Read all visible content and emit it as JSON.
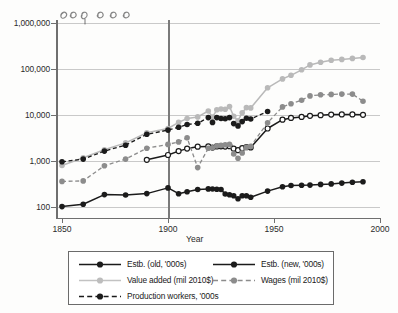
{
  "chart_data": {
    "type": "line",
    "title": "",
    "xlabel": "Year",
    "ylabel": "",
    "yscale": "log",
    "xlim": [
      1850,
      2000
    ],
    "ylim": [
      100,
      1000000
    ],
    "grid": true,
    "legend_position": "below",
    "y_ticks": [
      {
        "value": 100,
        "label": "100"
      },
      {
        "value": 1000,
        "label": "1,000"
      },
      {
        "value": 10000,
        "label": "10,000"
      },
      {
        "value": 100000,
        "label": "100,000"
      },
      {
        "value": 1000000,
        "label": "1,000,000"
      }
    ],
    "x_ticks": [
      {
        "value": 1850,
        "label": "1850"
      },
      {
        "value": 1900,
        "label": "1900"
      },
      {
        "value": 1950,
        "label": "1950"
      },
      {
        "value": 2000,
        "label": "2000"
      }
    ],
    "annotations": [
      {
        "name": "reference-line-1900",
        "type": "vline",
        "x": 1900
      },
      {
        "name": "handwritten-scribble",
        "type": "ink",
        "text": "1900"
      }
    ],
    "series": [
      {
        "name": "Estb. (old, '000s)",
        "color": "#1b1b1b",
        "style": "solid",
        "marker": "filled-circle",
        "points": [
          [
            1850,
            102
          ],
          [
            1860,
            115
          ],
          [
            1870,
            186
          ],
          [
            1880,
            182
          ],
          [
            1890,
            196
          ],
          [
            1900,
            260
          ],
          [
            1905,
            195
          ],
          [
            1909,
            215
          ],
          [
            1914,
            240
          ],
          [
            1919,
            247
          ],
          [
            1921,
            246
          ],
          [
            1923,
            244
          ],
          [
            1925,
            240
          ],
          [
            1927,
            192
          ],
          [
            1929,
            185
          ],
          [
            1931,
            176
          ],
          [
            1933,
            151
          ],
          [
            1935,
            176
          ],
          [
            1937,
            175
          ],
          [
            1939,
            163
          ],
          [
            1947,
            222
          ],
          [
            1954,
            276
          ],
          [
            1958,
            293
          ],
          [
            1963,
            297
          ],
          [
            1967,
            300
          ],
          [
            1972,
            310
          ],
          [
            1977,
            318
          ],
          [
            1982,
            330
          ],
          [
            1987,
            345
          ],
          [
            1992,
            355
          ]
        ]
      },
      {
        "name": "Estb. (new, '000s)",
        "color": "#1b1b1b",
        "style": "solid",
        "marker": "open-circle",
        "points": [
          [
            1890,
            1060
          ],
          [
            1900,
            1350
          ],
          [
            1905,
            1640
          ],
          [
            1909,
            1860
          ],
          [
            1914,
            2050
          ],
          [
            1919,
            2080
          ],
          [
            1921,
            1960
          ],
          [
            1923,
            2080
          ],
          [
            1925,
            2090
          ],
          [
            1927,
            2060
          ],
          [
            1929,
            2100
          ],
          [
            1931,
            1850
          ],
          [
            1933,
            1720
          ],
          [
            1935,
            1900
          ],
          [
            1937,
            2000
          ],
          [
            1939,
            1980
          ],
          [
            1947,
            5100
          ],
          [
            1954,
            7900
          ],
          [
            1958,
            8650
          ],
          [
            1963,
            9100
          ],
          [
            1967,
            9600
          ],
          [
            1972,
            9900
          ],
          [
            1977,
            10200
          ],
          [
            1982,
            10300
          ],
          [
            1987,
            10300
          ],
          [
            1992,
            10100
          ]
        ]
      },
      {
        "name": "Value added (mil 2010$)",
        "color": "#b9b9b9",
        "style": "solid",
        "marker": "filled-circle",
        "points": [
          [
            1850,
            800
          ],
          [
            1860,
            1180
          ],
          [
            1870,
            1760
          ],
          [
            1880,
            2480
          ],
          [
            1890,
            4100
          ],
          [
            1900,
            5100
          ],
          [
            1905,
            6900
          ],
          [
            1909,
            8400
          ],
          [
            1914,
            9100
          ],
          [
            1919,
            12200
          ],
          [
            1921,
            9000
          ],
          [
            1923,
            13000
          ],
          [
            1925,
            13500
          ],
          [
            1927,
            13300
          ],
          [
            1929,
            15200
          ],
          [
            1931,
            9400
          ],
          [
            1933,
            7500
          ],
          [
            1935,
            11200
          ],
          [
            1937,
            14500
          ],
          [
            1939,
            14300
          ],
          [
            1947,
            39000
          ],
          [
            1954,
            61000
          ],
          [
            1958,
            73000
          ],
          [
            1963,
            96000
          ],
          [
            1967,
            123000
          ],
          [
            1972,
            140000
          ],
          [
            1977,
            155000
          ],
          [
            1982,
            162000
          ],
          [
            1987,
            170000
          ],
          [
            1992,
            178000
          ]
        ]
      },
      {
        "name": "Wages (mil 2010$)",
        "color": "#8c8c8c",
        "style": "dashed",
        "marker": "filled-circle",
        "points": [
          [
            1850,
            360
          ],
          [
            1860,
            370
          ],
          [
            1870,
            790
          ],
          [
            1880,
            1100
          ],
          [
            1890,
            1900
          ],
          [
            1900,
            2300
          ],
          [
            1905,
            2600
          ],
          [
            1909,
            3200
          ],
          [
            1914,
            720
          ],
          [
            1919,
            1900
          ],
          [
            1921,
            1950
          ],
          [
            1923,
            2150
          ],
          [
            1925,
            2200
          ],
          [
            1927,
            2250
          ],
          [
            1929,
            2300
          ],
          [
            1931,
            1420
          ],
          [
            1933,
            1150
          ],
          [
            1935,
            1500
          ],
          [
            1937,
            2000
          ],
          [
            1939,
            2100
          ],
          [
            1947,
            6800
          ],
          [
            1954,
            15000
          ],
          [
            1958,
            17500
          ],
          [
            1963,
            21000
          ],
          [
            1967,
            26000
          ],
          [
            1972,
            27500
          ],
          [
            1977,
            28000
          ],
          [
            1982,
            28500
          ],
          [
            1987,
            28500
          ],
          [
            1992,
            20000
          ]
        ]
      },
      {
        "name": "Production workers, '000s",
        "color": "#1b1b1b",
        "style": "dashed",
        "marker": "filled-circle",
        "points": [
          [
            1850,
            960
          ],
          [
            1860,
            1100
          ],
          [
            1870,
            1640
          ],
          [
            1880,
            2200
          ],
          [
            1890,
            3800
          ],
          [
            1900,
            4700
          ],
          [
            1905,
            5400
          ],
          [
            1909,
            6200
          ],
          [
            1914,
            6600
          ],
          [
            1919,
            8800
          ],
          [
            1921,
            6900
          ],
          [
            1923,
            8800
          ],
          [
            1925,
            8400
          ],
          [
            1927,
            8300
          ],
          [
            1929,
            8800
          ],
          [
            1931,
            6500
          ],
          [
            1933,
            5800
          ],
          [
            1935,
            7200
          ],
          [
            1937,
            8500
          ],
          [
            1939,
            8200
          ],
          [
            1947,
            11900
          ]
        ]
      }
    ]
  },
  "legend": {
    "entries": [
      {
        "label": "Estb. (old, '000s)",
        "series": "estb-old"
      },
      {
        "label": "Estb. (new, '000s)",
        "series": "estb-new"
      },
      {
        "label": "Value added (mil 2010$)",
        "series": "value-added"
      },
      {
        "label": "Wages (mil 2010$)",
        "series": "wages"
      },
      {
        "label": "Production workers, '000s",
        "series": "production-workers"
      }
    ]
  },
  "colors": {
    "axis": "#6f6f6f",
    "grid": "#c9c9c9",
    "dark": "#1b1b1b",
    "light_gray": "#b9b9b9",
    "mid_gray": "#8c8c8c",
    "background": "#fdfdfc"
  }
}
